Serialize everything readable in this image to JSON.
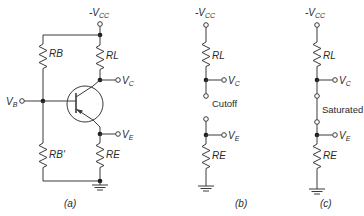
{
  "diagram": {
    "type": "transistor-switch-circuit",
    "panels": [
      {
        "id": "a",
        "caption": "(a)",
        "labels": {
          "supply": "-V",
          "supply_sub": "CC",
          "rb": "RB",
          "rl": "RL",
          "rb_prime": "RB'",
          "re": "RE",
          "vb": "V",
          "vb_sub": "B",
          "vc": "V",
          "vc_sub": "C",
          "ve": "V",
          "ve_sub": "E"
        },
        "components": [
          "RB",
          "RL",
          "RB'",
          "RE",
          "PNP transistor",
          "ground"
        ]
      },
      {
        "id": "b",
        "caption": "(b)",
        "state": "Cutoff",
        "labels": {
          "supply": "-V",
          "supply_sub": "CC",
          "rl": "RL",
          "re": "RE",
          "vc": "V",
          "vc_sub": "C",
          "ve": "V",
          "ve_sub": "E"
        }
      },
      {
        "id": "c",
        "caption": "(c)",
        "state": "Saturated",
        "labels": {
          "supply": "-V",
          "supply_sub": "CC",
          "rl": "RL",
          "re": "RE",
          "vc": "V",
          "vc_sub": "C",
          "ve": "V",
          "ve_sub": "E"
        }
      }
    ],
    "colors": {
      "line": "#3a3a3a",
      "node": "#1a1a1a",
      "background": "#ffffff"
    }
  }
}
